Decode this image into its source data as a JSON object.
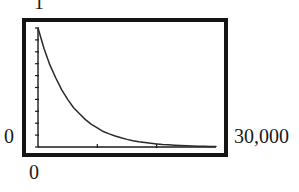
{
  "figure": {
    "kind": "plot-figure",
    "background_color": "#ffffff",
    "frame_color": "#141414",
    "curve_color": "#2a2a2a"
  },
  "axis_labels": {
    "y_max": "1",
    "y_min": "0",
    "x_min": "0",
    "x_max": "30,000"
  },
  "chart_data": {
    "type": "line",
    "title": "",
    "subtitle": "",
    "xlabel": "",
    "ylabel": "",
    "xlim": [
      0,
      30000
    ],
    "ylim": [
      0,
      1
    ],
    "xticks": [
      0,
      30000
    ],
    "xtick_labels": [
      "0",
      "30,000"
    ],
    "yticks": [
      0,
      1
    ],
    "ytick_labels": [
      "0",
      "1"
    ],
    "grid": false,
    "legend": null,
    "annotations": [],
    "minor_tick_count_y": 10,
    "minor_tick_count_x": 2,
    "series": [
      {
        "name": "decay",
        "x": [
          0,
          1000,
          2000,
          3000,
          4000,
          5000,
          6000,
          7000,
          8000,
          9000,
          10000,
          11000,
          12000,
          13000,
          14000,
          15000,
          16000,
          17000,
          18000,
          19000,
          20000,
          21000,
          22000,
          23000,
          24000,
          25000,
          26000,
          27000,
          28000,
          29000,
          30000
        ],
        "y": [
          1.0,
          0.83,
          0.69,
          0.58,
          0.48,
          0.4,
          0.33,
          0.28,
          0.23,
          0.19,
          0.16,
          0.13,
          0.11,
          0.092,
          0.077,
          0.064,
          0.053,
          0.044,
          0.037,
          0.031,
          0.026,
          0.021,
          0.018,
          0.015,
          0.012,
          0.01,
          0.0085,
          0.007,
          0.006,
          0.005,
          0.004
        ]
      }
    ]
  }
}
